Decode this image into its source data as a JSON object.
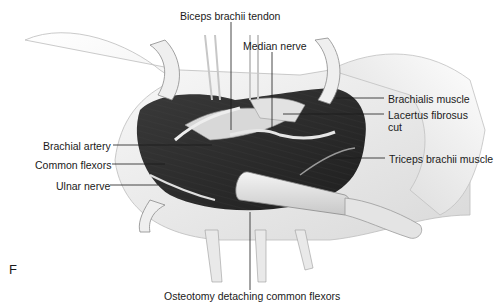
{
  "figure": {
    "panel_letter": "F",
    "labels": {
      "biceps_tendon": "Biceps brachii tendon",
      "median_nerve": "Median nerve",
      "brachialis": "Brachialis muscle",
      "lacertus_line1": "Lacertus fibrosus",
      "lacertus_line2": "cut",
      "brachial_artery": "Brachial artery",
      "common_flexors": "Common flexors",
      "triceps": "Triceps brachii muscle",
      "ulnar_nerve": "Ulnar nerve",
      "osteotomy": "Osteotomy detaching common flexors"
    },
    "colors": {
      "muscle": "#2a2a2a",
      "skin": "#f2f2f2",
      "retractor": "#e6e6e6",
      "line": "#1a1a1a"
    }
  }
}
